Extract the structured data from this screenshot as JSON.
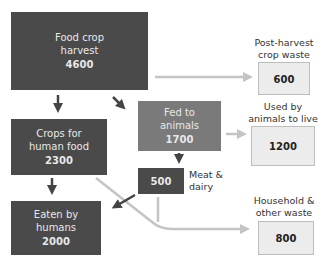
{
  "diagram": {
    "type": "flowchart",
    "nodes": [
      {
        "id": "harvest",
        "label": "Food crop harvest",
        "line1": "Food crop",
        "line2": "harvest",
        "value": "4600"
      },
      {
        "id": "crops_human",
        "label": "Crops for human food",
        "line1": "Crops for",
        "line2": "human food",
        "value": "2300"
      },
      {
        "id": "eaten",
        "label": "Eaten by humans",
        "line1": "Eaten by",
        "line2": "humans",
        "value": "2000"
      },
      {
        "id": "fed_animals",
        "label": "Fed to animals",
        "line1": "Fed to",
        "line2": "animals",
        "value": "1700"
      },
      {
        "id": "meat_dairy",
        "label": "Meat & dairy",
        "line1": "Meat &",
        "line2": "dairy",
        "value": "500"
      },
      {
        "id": "post_harvest_waste",
        "label": "Post-harvest crop waste",
        "line1": "Post-harvest",
        "line2": "crop waste",
        "value": "600"
      },
      {
        "id": "used_by_animals",
        "label": "Used by animals to live",
        "line1": "Used by",
        "line2": "animals to live",
        "value": "1200"
      },
      {
        "id": "household_waste",
        "label": "Household & other waste",
        "line1": "Household &",
        "line2": "other waste",
        "value": "800"
      }
    ],
    "edges": [
      {
        "from": "harvest",
        "to": "crops_human"
      },
      {
        "from": "harvest",
        "to": "fed_animals"
      },
      {
        "from": "harvest",
        "to": "post_harvest_waste"
      },
      {
        "from": "crops_human",
        "to": "eaten"
      },
      {
        "from": "crops_human",
        "to": "household_waste"
      },
      {
        "from": "fed_animals",
        "to": "meat_dairy"
      },
      {
        "from": "fed_animals",
        "to": "used_by_animals"
      },
      {
        "from": "meat_dairy",
        "to": "eaten"
      },
      {
        "from": "meat_dairy",
        "to": "household_waste"
      }
    ]
  },
  "colors": {
    "dark_box": "#4a4a4a",
    "mid_box": "#7a7a7a",
    "light_box": "#ececec",
    "dark_arrow": "#444444",
    "light_arrow": "#c4c4c4"
  }
}
